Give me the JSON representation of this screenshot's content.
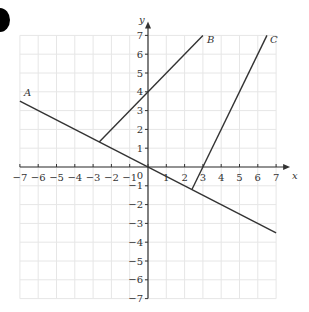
{
  "chart_data": {
    "type": "line",
    "title": "",
    "xlabel": "x",
    "ylabel": "y",
    "xlim": [
      -7,
      7
    ],
    "ylim": [
      -7,
      7
    ],
    "grid": true,
    "x_ticks": [
      -7,
      -6,
      -5,
      -4,
      -3,
      -2,
      -1,
      0,
      1,
      2,
      3,
      4,
      5,
      6,
      7
    ],
    "y_ticks": [
      -7,
      -6,
      -5,
      -4,
      -3,
      -2,
      -1,
      1,
      2,
      3,
      4,
      5,
      6,
      7
    ],
    "origin_label": "0",
    "series": [
      {
        "name": "A",
        "equation": "y = -x/2",
        "points": [
          [
            -7,
            3.5
          ],
          [
            7,
            -3.5
          ]
        ]
      },
      {
        "name": "B",
        "equation": "y = x + 4",
        "points": [
          [
            -2.667,
            1.333
          ],
          [
            3,
            7
          ]
        ]
      },
      {
        "name": "C",
        "equation": "y = 2x - 6",
        "points": [
          [
            2.4,
            -1.2
          ],
          [
            6.5,
            7
          ]
        ]
      }
    ],
    "line_color": "#333333",
    "grid_color": "#e6e6e6"
  }
}
